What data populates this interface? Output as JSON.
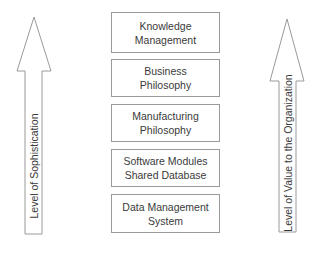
{
  "diagram": {
    "left_arrow": {
      "label": "Level of Sophistication"
    },
    "right_arrow": {
      "label": "Level of Value to the Organization"
    },
    "stack": [
      {
        "line1": "Knowledge",
        "line2": "Management"
      },
      {
        "line1": "Business",
        "line2": "Philosophy"
      },
      {
        "line1": "Manufacturing",
        "line2": "Philosophy"
      },
      {
        "line1": "Software Modules",
        "line2": "Shared Database"
      },
      {
        "line1": "Data Management",
        "line2": "System"
      }
    ],
    "colors": {
      "stroke": "#9a9a9a",
      "text": "#3a3a3a",
      "background": "#ffffff"
    }
  }
}
